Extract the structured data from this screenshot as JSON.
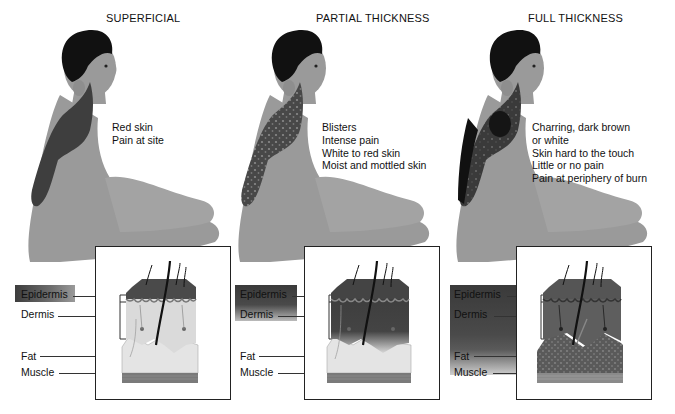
{
  "figure": {
    "panels": [
      {
        "id": "superficial",
        "title": "SUPERFICIAL",
        "description": [
          "Red skin",
          "Pain at site"
        ],
        "layers": [
          "Epidermis",
          "Dermis",
          "Fat",
          "Muscle"
        ],
        "burn_depth": "epidermis"
      },
      {
        "id": "partial",
        "title": "PARTIAL THICKNESS",
        "description": [
          "Blisters",
          "Intense pain",
          "White to red skin",
          "Moist and mottled skin"
        ],
        "layers": [
          "Epidermis",
          "Dermis",
          "Fat",
          "Muscle"
        ],
        "burn_depth": "dermis"
      },
      {
        "id": "full",
        "title": "FULL THICKNESS",
        "description": [
          "Charring, dark brown",
          "or white",
          "Skin hard to the touch",
          "Little or no pain",
          "Pain at periphery of burn"
        ],
        "layers": [
          "Epidermis",
          "Dermis",
          "Fat",
          "Muscle"
        ],
        "burn_depth": "fat"
      }
    ],
    "colors": {
      "skin": "#9a9a9a",
      "hair": "#111111",
      "burn_superficial": "#3e3e3e",
      "burn_partial": "#4a4a4a",
      "burn_full": "#2a2a2a",
      "epidermis": "#555555",
      "dermis": "#d8d8d8",
      "fat": "#e6e6e6",
      "muscle": "#777777"
    }
  }
}
